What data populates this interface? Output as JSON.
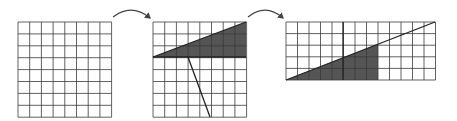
{
  "diagram": {
    "colors": {
      "grid_line": "#3a3a3a",
      "shade": "#555555",
      "background": "#ffffff",
      "arrow": "#444444"
    },
    "panels": [
      {
        "name": "square-grid",
        "x": 18,
        "y": 22,
        "cols": 8,
        "rows": 8,
        "cell_w": 11.7,
        "cell_h": 11.9,
        "shaded_polygon": [],
        "lines": []
      },
      {
        "name": "cut-square-grid",
        "x": 153,
        "y": 22,
        "cols": 8,
        "rows": 8,
        "cell_w": 11.7,
        "cell_h": 11.9,
        "shaded_polygon": [
          [
            153,
            57
          ],
          [
            246,
            22
          ],
          [
            246,
            57
          ]
        ],
        "lines": [
          [
            153,
            57,
            246,
            22
          ],
          [
            153,
            57,
            246,
            57
          ],
          [
            188,
            57,
            210,
            117
          ]
        ]
      },
      {
        "name": "rectangle-grid",
        "x": 286,
        "y": 22,
        "cols": 13,
        "rows": 5,
        "cell_w": 11.5,
        "cell_h": 11.6,
        "shaded_polygon": [
          [
            286,
            80
          ],
          [
            378,
            44
          ],
          [
            378,
            80
          ]
        ],
        "lines": [
          [
            286,
            80,
            435,
            22
          ],
          [
            343,
            22,
            343,
            80
          ]
        ]
      }
    ],
    "arrows": [
      {
        "name": "arrow-square-to-cut",
        "from": [
          113,
          17
        ],
        "to": [
          150,
          18
        ]
      },
      {
        "name": "arrow-cut-to-rectangle",
        "from": [
          248,
          17
        ],
        "to": [
          283,
          18
        ]
      }
    ]
  }
}
